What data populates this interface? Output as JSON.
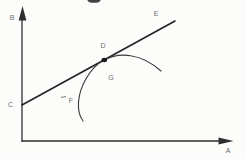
{
  "figure": {
    "kind": "scanned line diagram: straight line tangent to a concave curve",
    "colors": {
      "background": "#fcfcfb",
      "ink": "#2e2e2e",
      "label": "#6b6b6b"
    },
    "labels": {
      "vertical_axis": "B",
      "horizontal_axis": "A",
      "line_intercept": "C",
      "tangent_point": "D",
      "line_end": "E",
      "interior_point": "G",
      "curve_lower_end": "F"
    }
  }
}
